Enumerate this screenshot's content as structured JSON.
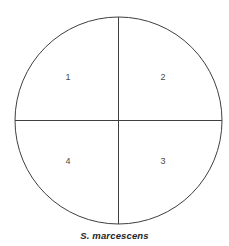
{
  "figure": {
    "name": "quadrant-streak-plate-diagram",
    "background_color": "#ffffff",
    "line_color": "#3f3f3f",
    "label_color": "#4a4a4a",
    "caption_color": "#262626"
  },
  "plate": {
    "shape": "circle",
    "center_x": 118.5,
    "center_y": 120.5,
    "radius": 103.5,
    "stroke_width": 1,
    "divider_vertical_x": 118.5,
    "divider_horizontal_y": 120.5
  },
  "quadrants": [
    {
      "id": "quadrant-1",
      "label": "1",
      "x": 68,
      "y": 78
    },
    {
      "id": "quadrant-2",
      "label": "2",
      "x": 163,
      "y": 78
    },
    {
      "id": "quadrant-3",
      "label": "3",
      "x": 163,
      "y": 162
    },
    {
      "id": "quadrant-4",
      "label": "4",
      "x": 68,
      "y": 162
    }
  ],
  "caption": {
    "text": "S. marcescens",
    "y": 231
  }
}
